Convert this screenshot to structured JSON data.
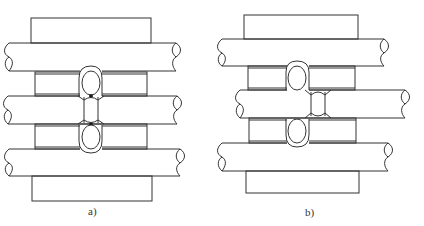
{
  "figure": {
    "caption_line_visible": false,
    "caption_blank_present": true,
    "panels": [
      {
        "id": "a",
        "label": "a)",
        "description": "Three-rod stack, welds aligned in one vertical column",
        "rods": 3,
        "spacers": 2,
        "weld_column_x": 90,
        "middle_weld_x": 90
      },
      {
        "id": "b",
        "label": "b)",
        "description": "Three-rod stack, middle rod weld offset to the right",
        "rods": 3,
        "spacers": 2,
        "weld_column_x": 297,
        "middle_weld_x": 318
      }
    ]
  },
  "colors": {
    "stroke": "#333333",
    "background": "#ffffff"
  }
}
